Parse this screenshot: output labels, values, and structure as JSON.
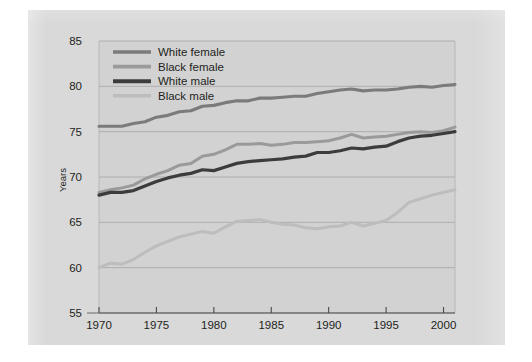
{
  "figure": {
    "background_color": "#d9d9d9",
    "page_color": "#ffffff",
    "plot_background_color": "#d2d2d2"
  },
  "axes": {
    "y_title": "Years",
    "y_ticks": [
      "85",
      "80",
      "75",
      "70",
      "65",
      "60",
      "55"
    ],
    "x_ticks": [
      "1970",
      "1975",
      "1980",
      "1985",
      "1990",
      "1995",
      "2000"
    ],
    "grid_color": "#a9a9a9",
    "axis_color": "#6d6d6d"
  },
  "legend": {
    "entries": [
      {
        "label": "White female",
        "color": "#7b7b7b"
      },
      {
        "label": "Black female",
        "color": "#9a9a9a"
      },
      {
        "label": "White male",
        "color": "#3c3c3c"
      },
      {
        "label": "Black male",
        "color": "#bdbdbd"
      }
    ]
  },
  "chart_data": {
    "type": "line",
    "title": "",
    "subtitle": "",
    "xlabel": "",
    "ylabel": "Years",
    "xlim": [
      1970,
      2001
    ],
    "ylim": [
      55,
      85
    ],
    "y_tick_values": [
      85,
      80,
      75,
      70,
      65,
      60,
      55
    ],
    "x_tick_values": [
      1970,
      1975,
      1980,
      1985,
      1990,
      1995,
      2000
    ],
    "grid": "horizontal",
    "legend_position": "top-left",
    "x": [
      1970,
      1971,
      1972,
      1973,
      1974,
      1975,
      1976,
      1977,
      1978,
      1979,
      1980,
      1981,
      1982,
      1983,
      1984,
      1985,
      1986,
      1987,
      1988,
      1989,
      1990,
      1991,
      1992,
      1993,
      1994,
      1995,
      1996,
      1997,
      1998,
      1999,
      2000,
      2001
    ],
    "series": [
      {
        "name": "White female",
        "color": "#7b7b7b",
        "values": [
          75.6,
          75.6,
          75.6,
          75.9,
          76.1,
          76.6,
          76.8,
          77.2,
          77.3,
          77.8,
          77.9,
          78.2,
          78.4,
          78.4,
          78.7,
          78.7,
          78.8,
          78.9,
          78.9,
          79.2,
          79.4,
          79.6,
          79.7,
          79.5,
          79.6,
          79.6,
          79.7,
          79.9,
          80.0,
          79.9,
          80.1,
          80.2
        ]
      },
      {
        "name": "Black female",
        "color": "#9a9a9a",
        "values": [
          68.3,
          68.6,
          68.8,
          69.1,
          69.8,
          70.3,
          70.7,
          71.3,
          71.5,
          72.3,
          72.5,
          73.0,
          73.6,
          73.6,
          73.7,
          73.5,
          73.6,
          73.8,
          73.8,
          73.9,
          74.0,
          74.3,
          74.7,
          74.3,
          74.4,
          74.5,
          74.7,
          74.9,
          75.0,
          74.9,
          75.1,
          75.5
        ]
      },
      {
        "name": "White male",
        "color": "#3c3c3c",
        "values": [
          68.0,
          68.3,
          68.3,
          68.5,
          69.0,
          69.5,
          69.9,
          70.2,
          70.4,
          70.8,
          70.7,
          71.1,
          71.5,
          71.7,
          71.8,
          71.9,
          72.0,
          72.2,
          72.3,
          72.7,
          72.7,
          72.9,
          73.2,
          73.1,
          73.3,
          73.4,
          73.9,
          74.3,
          74.5,
          74.6,
          74.8,
          75.0
        ]
      },
      {
        "name": "Black male",
        "color": "#bdbdbd",
        "values": [
          60.0,
          60.5,
          60.4,
          60.9,
          61.7,
          62.4,
          62.9,
          63.4,
          63.7,
          64.0,
          63.8,
          64.5,
          65.1,
          65.2,
          65.3,
          65.0,
          64.8,
          64.7,
          64.4,
          64.3,
          64.5,
          64.6,
          65.0,
          64.6,
          64.9,
          65.2,
          66.1,
          67.2,
          67.6,
          68.0,
          68.3,
          68.6
        ]
      }
    ]
  }
}
